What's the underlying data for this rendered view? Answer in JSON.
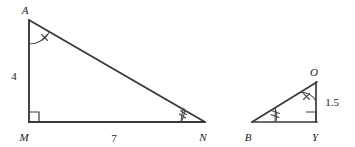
{
  "figure": {
    "background_color": "#ffffff",
    "stroke_color": "#3a3a3a",
    "label_color": "#1a1a1a"
  },
  "triangles": [
    {
      "name": "large-triangle",
      "id": "AMN",
      "vertices": [
        {
          "label": "A",
          "name": "vertex-label-a",
          "x": 29,
          "y": 20,
          "label_x": 25,
          "label_y": 14
        },
        {
          "label": "M",
          "name": "vertex-label-m",
          "x": 29,
          "y": 122,
          "label_x": 24,
          "label_y": 140
        },
        {
          "label": "N",
          "name": "vertex-label-n",
          "x": 204,
          "y": 122,
          "label_x": 202,
          "label_y": 140
        }
      ],
      "sides": [
        {
          "name": "side-am",
          "from": "A",
          "to": "M",
          "length_label": "4",
          "label_x": 13,
          "label_y": 76
        },
        {
          "name": "side-mn",
          "from": "M",
          "to": "N",
          "length_label": "7",
          "label_x": 113,
          "label_y": 141
        },
        {
          "name": "side-an",
          "from": "A",
          "to": "N",
          "length_label": "",
          "label_x": 0,
          "label_y": 0
        }
      ],
      "angle_marks": [
        {
          "name": "angle-mark-a",
          "vertex": "A",
          "type": "arc-cross-tick",
          "tick_count": 1
        },
        {
          "name": "angle-mark-m",
          "vertex": "M",
          "type": "right-angle-square"
        },
        {
          "name": "angle-mark-n",
          "vertex": "N",
          "type": "arc-double-tick",
          "tick_count": 2
        }
      ]
    },
    {
      "name": "small-triangle",
      "id": "BYO",
      "vertices": [
        {
          "label": "O",
          "name": "vertex-label-o",
          "x": 316,
          "y": 82,
          "label_x": 313,
          "label_y": 76
        },
        {
          "label": "B",
          "name": "vertex-label-b",
          "x": 253,
          "y": 122,
          "label_x": 248,
          "label_y": 140
        },
        {
          "label": "Y",
          "name": "vertex-label-y",
          "x": 316,
          "y": 122,
          "label_x": 313,
          "label_y": 140
        }
      ],
      "sides": [
        {
          "name": "side-oy",
          "from": "O",
          "to": "Y",
          "length_label": "1.5",
          "label_x": 323,
          "label_y": 106
        },
        {
          "name": "side-by",
          "from": "B",
          "to": "Y",
          "length_label": "",
          "label_x": 0,
          "label_y": 0
        },
        {
          "name": "side-bo",
          "from": "B",
          "to": "O",
          "length_label": "",
          "label_x": 0,
          "label_y": 0
        }
      ],
      "angle_marks": [
        {
          "name": "angle-mark-o",
          "vertex": "O",
          "type": "arc-cross-tick",
          "tick_count": 1
        },
        {
          "name": "angle-mark-y",
          "vertex": "Y",
          "type": "right-angle-square"
        },
        {
          "name": "angle-mark-b",
          "vertex": "B",
          "type": "arc-double-tick",
          "tick_count": 2
        }
      ]
    }
  ],
  "labels": {
    "vertex_a": "A",
    "vertex_m": "M",
    "vertex_n": "N",
    "vertex_o": "O",
    "vertex_b": "B",
    "vertex_y": "Y",
    "length_am": "4",
    "length_mn": "7",
    "length_oy": "1.5"
  }
}
